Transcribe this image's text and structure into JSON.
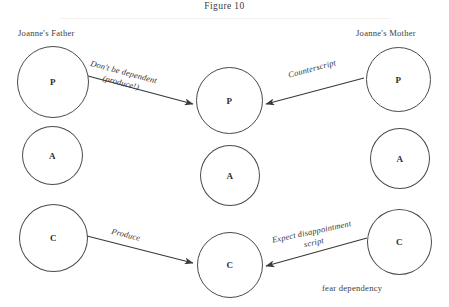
{
  "figure": {
    "title": "Figure 10",
    "note": "fear dependency"
  },
  "columns": [
    {
      "id": "father",
      "caption": "Joanne's Father"
    },
    {
      "id": "joanne",
      "caption": ""
    },
    {
      "id": "mother",
      "caption": "Joanne's Mother"
    }
  ],
  "ego_states": {
    "father": [
      {
        "letter": "P",
        "name": "Parent"
      },
      {
        "letter": "A",
        "name": "Adult"
      },
      {
        "letter": "C",
        "name": "Child"
      }
    ],
    "joanne": [
      {
        "letter": "P",
        "name": "Parent"
      },
      {
        "letter": "A",
        "name": "Adult"
      },
      {
        "letter": "C",
        "name": "Child"
      }
    ],
    "mother": [
      {
        "letter": "P",
        "name": "Parent"
      },
      {
        "letter": "A",
        "name": "Adult"
      },
      {
        "letter": "C",
        "name": "Child"
      }
    ]
  },
  "arrows": [
    {
      "id": "father-p-to-joanne-p",
      "from": "father.P",
      "to": "joanne.P",
      "label_line1": "Don't be dependent",
      "label_line2": "(produce!)"
    },
    {
      "id": "mother-p-to-joanne-p",
      "from": "mother.P",
      "to": "joanne.P",
      "label_line1": "Counterscript",
      "label_line2": ""
    },
    {
      "id": "father-c-to-joanne-c",
      "from": "father.C",
      "to": "joanne.C",
      "label_line1": "Produce",
      "label_line2": ""
    },
    {
      "id": "mother-c-to-joanne-c",
      "from": "mother.C",
      "to": "joanne.C",
      "label_line1": "Expect disappointment",
      "label_line2": "script"
    }
  ],
  "colors": {
    "stroke": "#4a4a4a",
    "text": "#2b2b2b",
    "background": "#ffffff"
  }
}
